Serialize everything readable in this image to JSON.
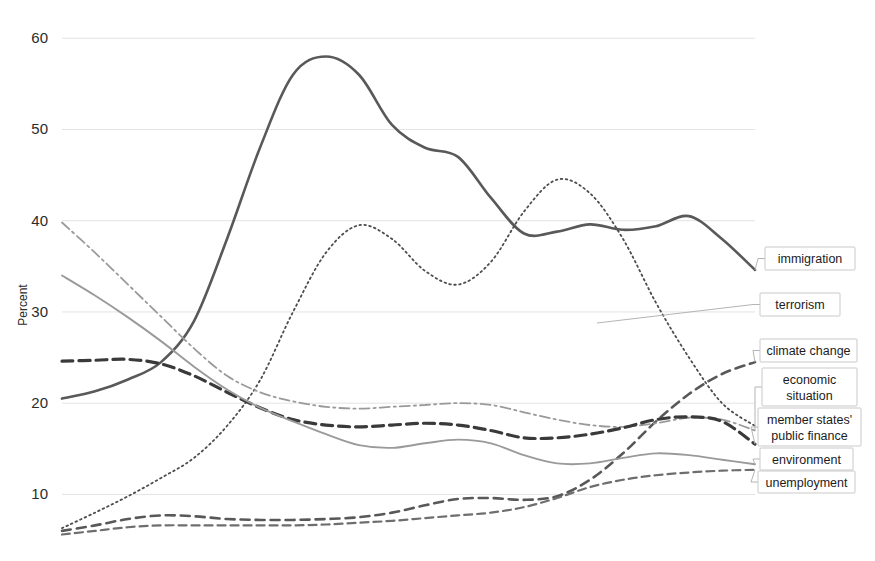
{
  "chart_data": {
    "type": "line",
    "title": "",
    "xlabel": "",
    "ylabel": "Percent",
    "ylim": [
      5,
      62
    ],
    "yticks": [
      10,
      20,
      30,
      40,
      50,
      60
    ],
    "ytick_labels": [
      "10",
      "20",
      "30",
      "40",
      "50",
      "60"
    ],
    "grid": true,
    "grid_axis": "y",
    "legend_position": "right-inline-labels",
    "x": [
      0,
      1,
      2,
      3,
      4,
      5,
      6,
      7,
      8,
      9,
      10,
      11,
      12,
      13,
      14,
      15,
      16,
      17,
      18,
      19,
      20
    ],
    "series": [
      {
        "name": "immigration",
        "style": "solid",
        "color": "#595959",
        "width": 2.6,
        "values": [
          20.5,
          21.3,
          22.6,
          24.5,
          29.0,
          38.0,
          48.0,
          56.0,
          58.0,
          56.0,
          50.5,
          48.0,
          47.0,
          42.5,
          38.6,
          38.8,
          39.6,
          39.0,
          39.4,
          40.5,
          38.0
        ],
        "end_value": 34.6
      },
      {
        "name": "terrorism",
        "style": "dotted",
        "color": "#4d4d4d",
        "width": 1.8,
        "values": [
          6.3,
          8.0,
          9.8,
          11.8,
          14.0,
          17.5,
          22.5,
          30.0,
          36.5,
          39.5,
          38.0,
          34.5,
          33.0,
          35.5,
          41.0,
          44.5,
          43.0,
          38.0,
          31.0,
          25.0,
          20.0
        ],
        "end_value": 17.5
      },
      {
        "name": "climate change",
        "style": "dashed",
        "color": "#585858",
        "width": 2.6,
        "values": [
          6.0,
          6.6,
          7.3,
          7.7,
          7.6,
          7.3,
          7.2,
          7.2,
          7.3,
          7.5,
          8.0,
          8.8,
          9.5,
          9.6,
          9.4,
          9.8,
          11.6,
          14.5,
          18.0,
          21.0,
          23.2
        ],
        "end_value": 24.5
      },
      {
        "name": "economic situation",
        "style": "dashdot",
        "color": "#9a9a9a",
        "width": 1.8,
        "values": [
          39.8,
          36.5,
          33.0,
          29.5,
          26.0,
          23.0,
          21.2,
          20.2,
          19.6,
          19.4,
          19.6,
          19.8,
          20.0,
          19.8,
          19.0,
          18.2,
          17.6,
          17.4,
          17.8,
          18.4,
          18.2
        ],
        "end_value": 17.0
      },
      {
        "name": "member states' public finance",
        "style": "dashed-bold",
        "color": "#3a3a3a",
        "width": 3.2,
        "values": [
          24.6,
          24.7,
          24.8,
          24.3,
          23.0,
          21.2,
          19.5,
          18.2,
          17.6,
          17.4,
          17.6,
          17.8,
          17.6,
          17.0,
          16.2,
          16.2,
          16.6,
          17.3,
          18.2,
          18.5,
          18.0
        ],
        "end_value": 15.5
      },
      {
        "name": "environment",
        "style": "solid-thin",
        "color": "#9a9a9a",
        "width": 1.9,
        "values": [
          34.0,
          31.8,
          29.4,
          26.8,
          24.0,
          21.5,
          19.5,
          18.0,
          16.6,
          15.4,
          15.1,
          15.6,
          16.0,
          15.6,
          14.3,
          13.4,
          13.4,
          14.0,
          14.5,
          14.3,
          13.8
        ],
        "end_value": 13.3
      },
      {
        "name": "unemployment",
        "style": "dashed-thin",
        "color": "#6e6e6e",
        "width": 2.2,
        "values": [
          5.6,
          6.0,
          6.4,
          6.6,
          6.6,
          6.6,
          6.6,
          6.6,
          6.7,
          6.9,
          7.1,
          7.4,
          7.7,
          8.0,
          8.6,
          9.6,
          10.8,
          11.6,
          12.1,
          12.4,
          12.6
        ],
        "end_value": 12.7
      }
    ],
    "annotations": [
      {
        "label": "immigration",
        "lines": [
          "immigration"
        ]
      },
      {
        "label": "terrorism",
        "lines": [
          "terrorism"
        ]
      },
      {
        "label": "climate change",
        "lines": [
          "climate change"
        ]
      },
      {
        "label": "economic situation",
        "lines": [
          "economic",
          "situation"
        ]
      },
      {
        "label": "member states' public finance",
        "lines": [
          "member states'",
          "public finance"
        ]
      },
      {
        "label": "environment",
        "lines": [
          "environment"
        ]
      },
      {
        "label": "unemployment",
        "lines": [
          "unemployment"
        ]
      }
    ]
  }
}
